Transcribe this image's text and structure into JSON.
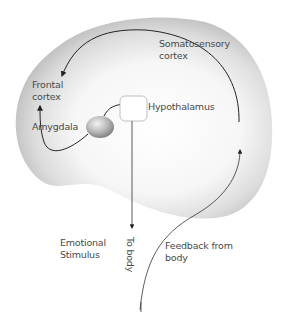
{
  "diagram": {
    "title": "",
    "labels": {
      "frontal_cortex": "Frontal\ncortex",
      "somatosensory_cortex": "Somatosensory\ncortex",
      "amygdala": "Amygdala",
      "hypothalamus": "Hypothalamus",
      "emotional_stimulus": "Emotional\nStimulus",
      "to_body": "To body",
      "feedback_from_body": "Feedback from\nbody"
    },
    "nodes": [
      {
        "id": "amygdala",
        "label": "Amygdala",
        "shape": "ellipse"
      },
      {
        "id": "hypothalamus",
        "label": "Hypothalamus",
        "shape": "rounded-rect"
      },
      {
        "id": "frontal_cortex",
        "label": "Frontal cortex",
        "shape": "region"
      },
      {
        "id": "somatosensory_cortex",
        "label": "Somatosensory cortex",
        "shape": "region"
      }
    ],
    "edges": [
      {
        "from": "amygdala",
        "to": "hypothalamus"
      },
      {
        "from": "amygdala",
        "to": "frontal_cortex"
      },
      {
        "from": "hypothalamus",
        "to": "body",
        "label": "To body"
      },
      {
        "from": "body",
        "to": "somatosensory_cortex",
        "label": "Feedback from body"
      },
      {
        "from": "somatosensory_cortex",
        "to": "frontal_cortex"
      }
    ],
    "colors": {
      "brain_shade": "#b8b8b8",
      "line": "#333333",
      "text": "#4a4a4a"
    }
  }
}
